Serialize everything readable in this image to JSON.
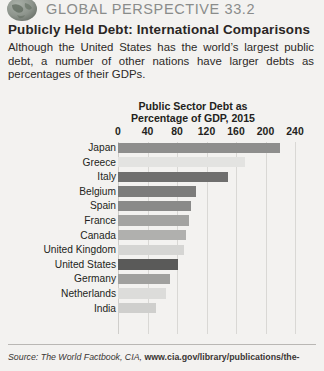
{
  "header": {
    "series_label": "GLOBAL PERSPECTIVE 33.2",
    "globe_icon": "globe-icon"
  },
  "feature": {
    "title": "Publicly Held Debt: International Comparisons",
    "intro": "Although the United States has the world’s largest public debt, a number of other nations have larger debts as percentages of their GDPs."
  },
  "chart_data": {
    "type": "bar",
    "orientation": "horizontal",
    "title": "Public Sector Debt as\nPercentage of GDP, 2015",
    "title_line1": "Public Sector Debt as",
    "title_line2": "Percentage of GDP, 2015",
    "xlabel": "",
    "ylabel": "",
    "xlim": [
      0,
      240
    ],
    "xticks": [
      0,
      40,
      80,
      120,
      160,
      200,
      240
    ],
    "xtick_labels": [
      "0",
      "40",
      "80",
      "120",
      "160",
      "200",
      "240"
    ],
    "grid": true,
    "legend": "none",
    "categories": [
      "Japan",
      "Greece",
      "Italy",
      "Belgium",
      "Spain",
      "France",
      "Canada",
      "United Kingdom",
      "United States",
      "Germany",
      "Netherlands",
      "India"
    ],
    "values": [
      220,
      172,
      149,
      106,
      99,
      96,
      92,
      89,
      81,
      71,
      65,
      51
    ],
    "bar_colors": [
      "#8e8e8d",
      "#e3e3e1",
      "#6f6f6e",
      "#7c7c7b",
      "#8a8a89",
      "#a3a3a1",
      "#b0b0ae",
      "#d5d5d3",
      "#5a5a59",
      "#a0a09e",
      "#dcdcda",
      "#cfcfcd"
    ]
  },
  "source": {
    "prefix": "Source: The World Factbook, CIA, ",
    "url": "www.cia.gov/library/publications/the-"
  }
}
